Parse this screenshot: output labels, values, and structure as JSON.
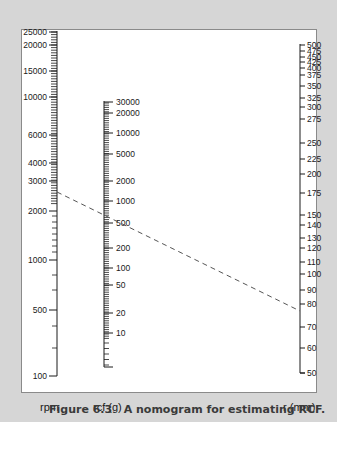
{
  "figure": {
    "caption": "Figure 6.3   A nomogram for estimating RCF.",
    "caption_number": "Figure 6.3",
    "caption_text": "A nomogram for estimating RCF."
  },
  "axes": {
    "rpm": {
      "label": "rpm",
      "ticks": [
        {
          "value": "25000",
          "y": 32
        },
        {
          "value": "20000",
          "y": 45
        },
        {
          "value": "15000",
          "y": 71
        },
        {
          "value": "10000",
          "y": 97
        },
        {
          "value": "6000",
          "y": 135
        },
        {
          "value": "4000",
          "y": 163
        },
        {
          "value": "3000",
          "y": 181
        },
        {
          "value": "2000",
          "y": 211
        },
        {
          "value": "1000",
          "y": 260
        },
        {
          "value": "500",
          "y": 310
        },
        {
          "value": "100",
          "y": 376
        }
      ]
    },
    "rcf": {
      "label": "rcf (g)",
      "ticks": [
        {
          "value": "30000",
          "y": 102
        },
        {
          "value": "20000",
          "y": 113
        },
        {
          "value": "10000",
          "y": 133
        },
        {
          "value": "5000",
          "y": 154
        },
        {
          "value": "2000",
          "y": 181
        },
        {
          "value": "1000",
          "y": 201
        },
        {
          "value": "500",
          "y": 223
        },
        {
          "value": "200",
          "y": 248
        },
        {
          "value": "100",
          "y": 268
        },
        {
          "value": "50",
          "y": 285
        },
        {
          "value": "20",
          "y": 313
        },
        {
          "value": "10",
          "y": 333
        }
      ]
    },
    "r": {
      "label": "r (mm)",
      "ticks": [
        {
          "value": "500",
          "y": 45
        },
        {
          "value": "475",
          "y": 51
        },
        {
          "value": "450",
          "y": 57
        },
        {
          "value": "425",
          "y": 62
        },
        {
          "value": "400",
          "y": 68
        },
        {
          "value": "375",
          "y": 75
        },
        {
          "value": "350",
          "y": 86
        },
        {
          "value": "325",
          "y": 98
        },
        {
          "value": "300",
          "y": 107
        },
        {
          "value": "275",
          "y": 119
        },
        {
          "value": "250",
          "y": 143
        },
        {
          "value": "225",
          "y": 159
        },
        {
          "value": "200",
          "y": 174
        },
        {
          "value": "175",
          "y": 193
        },
        {
          "value": "150",
          "y": 215
        },
        {
          "value": "140",
          "y": 225
        },
        {
          "value": "130",
          "y": 238
        },
        {
          "value": "120",
          "y": 248
        },
        {
          "value": "110",
          "y": 262
        },
        {
          "value": "100",
          "y": 274
        },
        {
          "value": "90",
          "y": 290
        },
        {
          "value": "80",
          "y": 304
        },
        {
          "value": "70",
          "y": 327
        },
        {
          "value": "60",
          "y": 348
        },
        {
          "value": "50",
          "y": 373
        }
      ]
    }
  },
  "example_line": {
    "style": "dashed",
    "from": {
      "axis": "rpm",
      "approx_value": "2500"
    },
    "through": {
      "axis": "rcf",
      "approx_value": "550"
    },
    "to": {
      "axis": "r",
      "approx_value": "77"
    }
  },
  "colors": {
    "background": "#d6d6d6",
    "panel": "#ffffff",
    "ink": "#1a1a1a",
    "dashed_line": "#555555"
  }
}
